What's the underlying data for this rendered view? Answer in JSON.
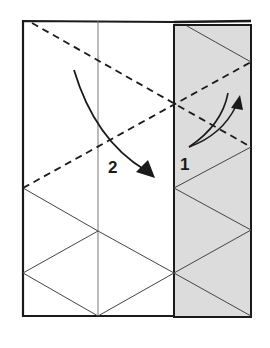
{
  "diagram": {
    "type": "origami-fold-instruction",
    "colors": {
      "paper": "#ffffff",
      "shaded_flap": "#dcdcdc",
      "line": "#1a1a1a",
      "thin_line": "#555555"
    },
    "steps": [
      {
        "number": "1",
        "description": "fold shaded flap upward along dashed line"
      },
      {
        "number": "2",
        "description": "fold left portion down along dashed line"
      }
    ],
    "labels": {
      "step1": "1",
      "step2": "2"
    }
  }
}
